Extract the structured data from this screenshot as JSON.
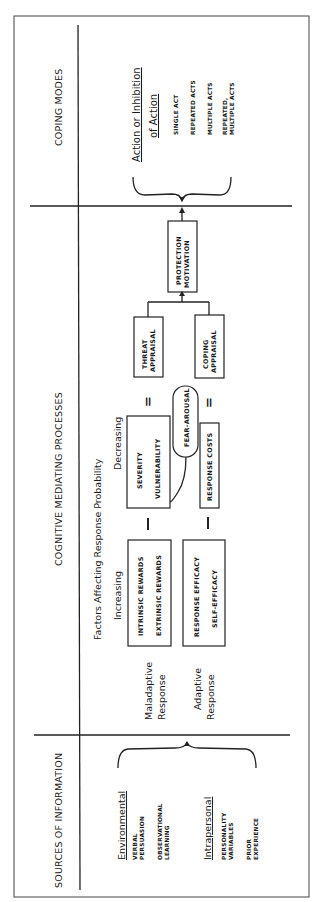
{
  "sections": {
    "sources": "SOURCES OF INFORMATION",
    "cognitive": "COGNITIVE MEDIATING PROCESSES",
    "coping": "COPING MODES"
  },
  "sources": {
    "environmental": {
      "heading": "Environmental",
      "items": [
        [
          "VERBAL",
          "PERSUASION"
        ],
        [
          "OBSERVATIONAL",
          "LEARNING"
        ]
      ]
    },
    "intrapersonal": {
      "heading": "Intrapersonal",
      "items": [
        [
          "PERSONALITY",
          "VARIABLES"
        ],
        [
          "PRIOR",
          "EXPERIENCE"
        ]
      ]
    }
  },
  "cognitive": {
    "factors_heading": "Factors Affecting Response Probability",
    "increasing": "Increasing",
    "decreasing": "Decreasing",
    "maladaptive": [
      "Maladaptive",
      "Response"
    ],
    "adaptive": [
      "Adaptive",
      "Response"
    ],
    "rewards_box": [
      "INTRINSIC REWARDS",
      "EXTRINSIC REWARDS"
    ],
    "efficacy_box": [
      "RESPONSE EFFICACY",
      "SELF-EFFICACY"
    ],
    "severity_box": [
      "SEVERITY",
      "VULNERABILITY"
    ],
    "costs_box": "RESPONSE COSTS",
    "fear_arousal": "FEAR-AROUSAL",
    "threat_appraisal": [
      "THREAT",
      "APPRAISAL"
    ],
    "coping_appraisal": [
      "COPING",
      "APPRAISAL"
    ],
    "protection_motivation": [
      "PROTECTION",
      "MOTIVATION"
    ],
    "minus_sign": "−",
    "equals_sign": "="
  },
  "coping": {
    "heading": [
      "Action or Inhibition",
      "of Action"
    ],
    "items": [
      [
        "SINGLE ACT"
      ],
      [
        "REPEATED ACTS"
      ],
      [
        "MULTIPLE ACTS"
      ],
      [
        "REPEATED,",
        "MULTIPLE ACTS"
      ]
    ]
  }
}
